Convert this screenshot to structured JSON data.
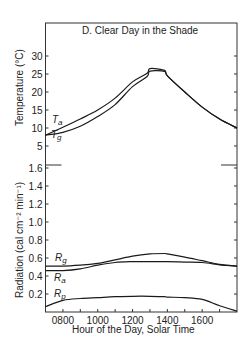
{
  "chart_data": [
    {
      "type": "line",
      "panel": "upper",
      "title": "D.  Clear Day in the Shade",
      "xlabel": "Hour of the Day, Solar Time",
      "ylabel": "Temperature (°C)",
      "ylim": [
        0,
        33
      ],
      "xlim": [
        700,
        1800
      ],
      "yticks": [
        5,
        10,
        15,
        20,
        25,
        30
      ],
      "grid": false,
      "x": [
        700,
        800,
        900,
        1000,
        1100,
        1200,
        1250,
        1300,
        1350,
        1400,
        1500,
        1600,
        1700,
        1800
      ],
      "series": [
        {
          "name": "Ta",
          "values": [
            8.0,
            10.2,
            12.5,
            15.0,
            18.3,
            22.8,
            25.2,
            26.5,
            26.0,
            24.5,
            20.0,
            15.8,
            12.5,
            10.0
          ]
        },
        {
          "name": "Tg",
          "values": [
            8.0,
            8.8,
            10.5,
            13.2,
            16.5,
            21.5,
            24.3,
            25.8,
            25.7,
            24.5,
            20.0,
            15.8,
            12.5,
            10.0
          ]
        }
      ]
    },
    {
      "type": "line",
      "panel": "lower",
      "xlabel": "Hour of the Day, Solar Time",
      "ylabel": "Radiation (cal cm⁻² min⁻¹)",
      "ylim": [
        0,
        1.8
      ],
      "xlim": [
        700,
        1800
      ],
      "yticks": [
        0.2,
        0.4,
        0.6,
        0.8,
        1.0,
        1.2,
        1.4,
        1.6
      ],
      "xticks": [
        "0800",
        "1000",
        "1200",
        "1400",
        "1600"
      ],
      "grid": false,
      "x": [
        700,
        800,
        900,
        1000,
        1100,
        1200,
        1300,
        1350,
        1400,
        1500,
        1600,
        1700,
        1800
      ],
      "series": [
        {
          "name": "Rg",
          "values": [
            0.51,
            0.51,
            0.52,
            0.54,
            0.58,
            0.62,
            0.645,
            0.65,
            0.645,
            0.61,
            0.57,
            0.53,
            0.51
          ]
        },
        {
          "name": "Ra",
          "values": [
            0.46,
            0.46,
            0.48,
            0.52,
            0.55,
            0.56,
            0.56,
            0.56,
            0.56,
            0.555,
            0.55,
            0.525,
            0.51
          ]
        },
        {
          "name": "Rp",
          "values": [
            0.06,
            0.13,
            0.15,
            0.16,
            0.17,
            0.175,
            0.175,
            0.17,
            0.165,
            0.16,
            0.14,
            0.07,
            0.01
          ]
        }
      ]
    }
  ],
  "labels": {
    "title": "D.  Clear Day in the Shade",
    "xlabel": "Hour of the Day, Solar Time",
    "temp_ylabel": "Temperature (°C)",
    "rad_ylabel": "Radiation (cal cm⁻² min⁻¹)",
    "series": {
      "Ta": {
        "main": "T",
        "sub": "a"
      },
      "Tg": {
        "main": "T",
        "sub": "g"
      },
      "Rg": {
        "main": "R",
        "sub": "g"
      },
      "Ra": {
        "main": "R",
        "sub": "a"
      },
      "Rp": {
        "main": "R",
        "sub": "p"
      }
    }
  },
  "colors": {
    "line": "#1a1a1a",
    "frame": "#333333"
  }
}
